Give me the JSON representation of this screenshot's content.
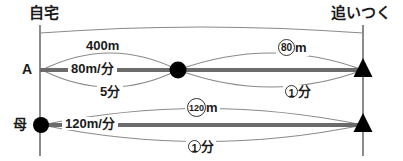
{
  "diagram": {
    "title_left": "自宅",
    "title_right": "追いつく",
    "colors": {
      "ink": "#1a1a1a",
      "thick_line": "#5a5a5a",
      "thin_line": "#7a7a7a",
      "marker": "#000000",
      "background": "#ffffff"
    },
    "rows": [
      {
        "name": "row-a",
        "label": "A",
        "speed": "80m/分",
        "segments": [
          {
            "name": "segment-head-start",
            "distance": "400m",
            "time": "5分"
          },
          {
            "name": "segment-catch-up",
            "distance_value": "80",
            "distance_unit": "m",
            "time_value": "1",
            "time_unit": "分"
          }
        ]
      },
      {
        "name": "row-mother",
        "label": "母",
        "speed": "120m/分",
        "segments": [
          {
            "name": "segment-full",
            "distance_value": "120",
            "distance_unit": "m",
            "time_value": "1",
            "time_unit": "分"
          }
        ]
      }
    ],
    "markers": {
      "meeting_dot": "filled-circle-marker",
      "catch_up_a": "filled-triangle-marker",
      "catch_up_mother": "filled-triangle-marker",
      "home_dot": "filled-circle-marker"
    }
  }
}
